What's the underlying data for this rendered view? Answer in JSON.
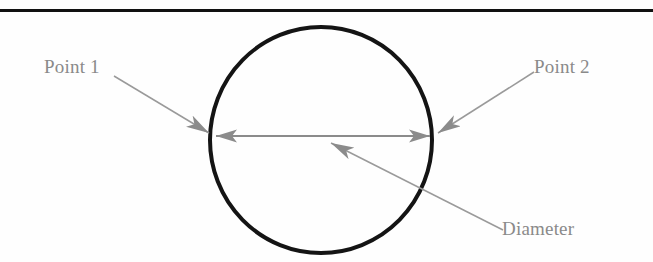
{
  "figure": {
    "width": 653,
    "height": 262,
    "background_color": "#fefefe",
    "top_rule": {
      "name": "horizontal-rule",
      "color": "#111111",
      "x1": 0,
      "x2": 653,
      "y": 10,
      "thickness": 3
    },
    "circle": {
      "name": "circle-outline",
      "stroke_color": "#141414",
      "stroke_width": 4,
      "fill": "none",
      "center_x": 321,
      "center_y": 140,
      "radius_x": 111,
      "radius_y": 113
    },
    "diameter_arrow": {
      "name": "diameter-double-arrow",
      "color": "#8b8b8b",
      "line_width": 2,
      "x1": 214,
      "y1": 136,
      "x2": 432,
      "y2": 136,
      "double_headed": true
    },
    "leaders": [
      {
        "name": "point-1-leader",
        "color": "#9a9a9a",
        "line_width": 1.5,
        "x1": 114,
        "y1": 76,
        "x2": 211,
        "y2": 134
      },
      {
        "name": "point-2-leader",
        "color": "#9a9a9a",
        "line_width": 1.5,
        "x1": 534,
        "y1": 72,
        "x2": 436,
        "y2": 134
      },
      {
        "name": "diameter-leader",
        "color": "#9a9a9a",
        "line_width": 1.5,
        "x1": 503,
        "y1": 230,
        "x2": 329,
        "y2": 142
      }
    ],
    "labels": {
      "point_1": "Point 1",
      "point_2": "Point 2",
      "diameter": "Diameter"
    },
    "label_color": "#8a8a8a"
  }
}
